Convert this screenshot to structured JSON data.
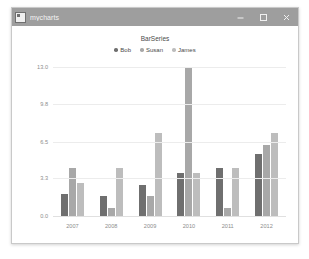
{
  "window": {
    "title": "mycharts",
    "icon": "app-icon",
    "controls": [
      {
        "name": "minimize-button",
        "glyph": "minimize-icon",
        "label": "Minimize"
      },
      {
        "name": "maximize-button",
        "glyph": "maximize-icon",
        "label": "Maximize"
      },
      {
        "name": "close-button",
        "glyph": "close-icon",
        "label": "Close"
      }
    ],
    "titlebar_color": "#9e9e9e",
    "background_color": "#ffffff"
  },
  "chart_data": {
    "type": "bar",
    "title": "BarSeries",
    "xlabel": "",
    "ylabel": "",
    "categories": [
      "2007",
      "2008",
      "2009",
      "2010",
      "2011",
      "2012"
    ],
    "series": [
      {
        "name": "Bob",
        "color": "#6f6f6f",
        "values": [
          2.0,
          1.8,
          2.8,
          3.8,
          4.3,
          5.5
        ]
      },
      {
        "name": "Susan",
        "color": "#a8a8a8",
        "values": [
          4.3,
          0.8,
          1.8,
          13.0,
          0.8,
          6.3
        ]
      },
      {
        "name": "James",
        "color": "#bdbdbd",
        "values": [
          3.0,
          4.3,
          7.3,
          3.8,
          4.3,
          7.3
        ]
      }
    ],
    "ylim": [
      0.0,
      13.0
    ],
    "yticks": [
      "0.0",
      "3.3",
      "6.5",
      "9.8",
      "13.0"
    ],
    "ytick_values": [
      0.0,
      3.3,
      6.5,
      9.8,
      13.0
    ],
    "grid": true,
    "legend_position": "top"
  }
}
